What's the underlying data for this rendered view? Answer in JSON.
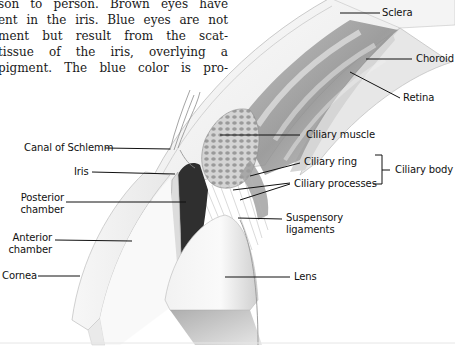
{
  "paragraph": {
    "lines": [
      "son to person. Brown eyes have",
      "ent in the iris. Blue eyes are not",
      "ment but result from the scat-",
      " tissue of the iris, overlying a",
      "pigment. The blue color is pro-"
    ]
  },
  "figure": {
    "labels": {
      "sclera": "Sclera",
      "choroid": "Choroid",
      "retina": "Retina",
      "canal_of_schlemm": "Canal of Schlemm",
      "ciliary_muscle": "Ciliary muscle",
      "iris": "Iris",
      "ciliary_ring": "Ciliary ring",
      "ciliary_processes": "Ciliary processes",
      "ciliary_body": "Ciliary body",
      "posterior_chamber": [
        "Posterior",
        "chamber"
      ],
      "suspensory_ligaments": [
        "Suspensory",
        "ligaments"
      ],
      "anterior_chamber": [
        "Anterior",
        "chamber"
      ],
      "cornea": "Cornea",
      "lens": "Lens"
    }
  }
}
